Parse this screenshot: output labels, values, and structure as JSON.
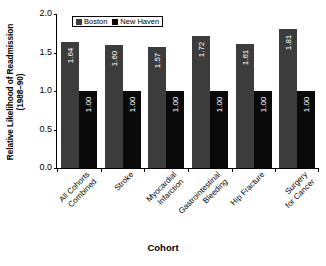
{
  "chart_data": {
    "type": "bar",
    "title": "",
    "xlabel": "Cohort",
    "ylabel": "Relative Likelihood of Readmission (1988–90)",
    "ylabel_line1": "Relative Likelihood of Readmission",
    "ylabel_line2": "(1988–90)",
    "ylim": [
      0.0,
      2.0
    ],
    "yticks": [
      "0.0",
      "0.5",
      "1.0",
      "1.5",
      "2.0"
    ],
    "ytick_values": [
      0.0,
      0.5,
      1.0,
      1.5,
      2.0
    ],
    "grid": false,
    "legend_position": "top-left-inside",
    "categories": [
      "All Cohorts Combined",
      "Stroke",
      "Myocardial Infarction",
      "Gastrointestinal Bleeding",
      "Hip Fracture",
      "Surgery for Cancer"
    ],
    "category_lines": [
      [
        "All Cohorts",
        "Combined"
      ],
      [
        "Stroke"
      ],
      [
        "Myocardial",
        "Infarction"
      ],
      [
        "Gastrointestinal",
        "Bleeding"
      ],
      [
        "Hip Fracture"
      ],
      [
        "Surgery",
        "for Cancer"
      ]
    ],
    "series": [
      {
        "name": "Boston",
        "color": "#3c3c3c",
        "values": [
          1.64,
          1.6,
          1.57,
          1.72,
          1.61,
          1.81
        ],
        "labels": [
          "1.64",
          "1.60",
          "1.57",
          "1.72",
          "1.61",
          "1.81"
        ]
      },
      {
        "name": "New Haven",
        "color": "#0a0a0a",
        "values": [
          1.0,
          1.0,
          1.0,
          1.0,
          1.0,
          1.0
        ],
        "labels": [
          "1.00",
          "1.00",
          "1.00",
          "1.00",
          "1.00",
          "1.00"
        ]
      }
    ]
  },
  "legend": {
    "items": [
      {
        "label": "Boston",
        "color": "#3c3c3c"
      },
      {
        "label": "New Haven",
        "color": "#0a0a0a"
      }
    ]
  },
  "colors": {
    "boston": "#3c3c3c",
    "new_haven": "#0a0a0a",
    "axis": "#000000",
    "background": "#ffffff",
    "value_label": "#ffffff"
  }
}
